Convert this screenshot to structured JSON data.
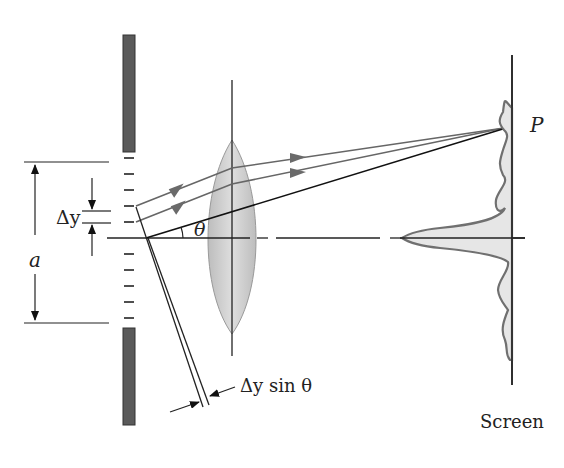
{
  "diagram": {
    "labels": {
      "point_p": "P",
      "slit_width": "a",
      "delta_y": "Δy",
      "theta": "θ",
      "path_difference": "Δy sin θ",
      "screen": "Screen"
    },
    "colors": {
      "line": "#222222",
      "ray": "#666666",
      "arrowhead": "#6a6a6a",
      "barrier": "#5a5a5a",
      "lens_fill": "#cfcfcf",
      "pattern_fill": "#e6e6e6",
      "pattern_curve": "#707070"
    },
    "slit_source_count": 12
  }
}
